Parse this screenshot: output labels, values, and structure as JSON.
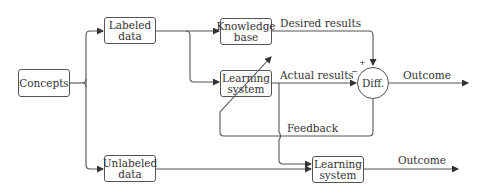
{
  "diagram": {
    "nodes": {
      "concepts": "Concepts",
      "labeled_data": [
        "Labeled",
        "data"
      ],
      "unlabeled_data": [
        "Unlabeled",
        "data"
      ],
      "knowledge_base": [
        "Knowledge",
        "base"
      ],
      "learning_system_top": [
        "Learning",
        "system"
      ],
      "learning_system_bottom": [
        "Learning",
        "system"
      ],
      "diff": "Diff."
    },
    "edge_labels": {
      "desired_results": "Desired results",
      "actual_results": "Actual results",
      "outcome_top": "Outcome",
      "feedback": "Feedback",
      "outcome_bottom": "Outcome"
    },
    "signs": {
      "plus": "+",
      "minus": "−"
    },
    "colors": {
      "line": "#555555",
      "text": "#333333",
      "background": "#ffffff"
    }
  }
}
